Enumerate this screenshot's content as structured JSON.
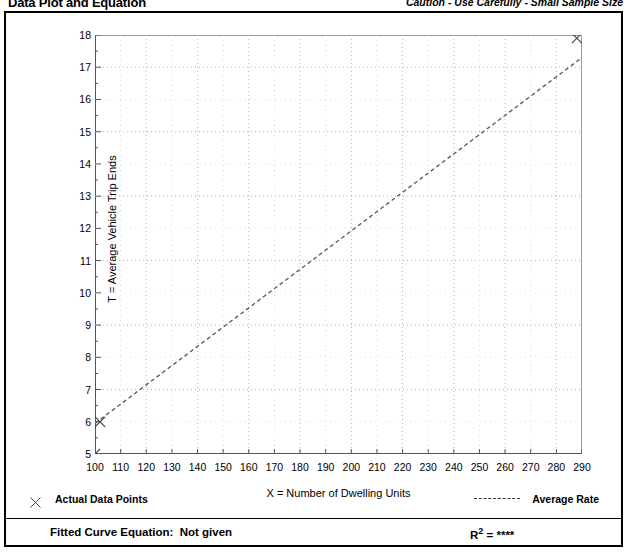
{
  "header": {
    "title": "Data Plot and Equation",
    "caution": "Caution - Use Carefully - Small Sample Size"
  },
  "legend": {
    "data_points_label": "Actual Data Points",
    "average_rate_label": "Average Rate",
    "data_points_marker": "x-marker-icon",
    "average_rate_marker": "dashed-line-icon"
  },
  "equation": {
    "fitted_label": "Fitted Curve Equation:  Not given",
    "r_squared_prefix": "R",
    "r_squared_exponent": "2",
    "r_squared_value": " = ****"
  },
  "colors": {
    "axis": "#555555",
    "grid": "#b4b4b4",
    "line": "#555555",
    "marker": "#444444",
    "frame": "#000000"
  },
  "chart_data": {
    "type": "scatter",
    "title": "Data Plot and Equation",
    "xlabel": "X = Number of Dwelling Units",
    "ylabel": "T = Average Vehicle Trip Ends",
    "xlim": [
      100,
      290
    ],
    "ylim": [
      5,
      18
    ],
    "xticks": [
      100,
      110,
      120,
      130,
      140,
      150,
      160,
      170,
      180,
      190,
      200,
      210,
      220,
      230,
      240,
      250,
      260,
      270,
      280,
      290
    ],
    "yticks": [
      5,
      6,
      7,
      8,
      9,
      10,
      11,
      12,
      13,
      14,
      15,
      16,
      17,
      18
    ],
    "minor_y_ticks": true,
    "grid": true,
    "grid_style": "dotted",
    "grid_x_major_every": 20,
    "grid_y_major_every": 2,
    "legend_position": "below-plot",
    "series": [
      {
        "name": "Actual Data Points",
        "type": "scatter",
        "marker": "x",
        "points": [
          {
            "x": 100,
            "y": 5.0
          },
          {
            "x": 102,
            "y": 6.0
          },
          {
            "x": 288,
            "y": 17.9
          }
        ]
      },
      {
        "name": "Average Rate",
        "type": "line",
        "style": "dashed",
        "points": [
          {
            "x": 100,
            "y": 5.95
          },
          {
            "x": 290,
            "y": 17.3
          }
        ]
      }
    ],
    "annotations": [
      "Fitted Curve Equation:  Not given",
      "R2 = ****",
      "Caution - Use Carefully - Small Sample Size"
    ]
  }
}
